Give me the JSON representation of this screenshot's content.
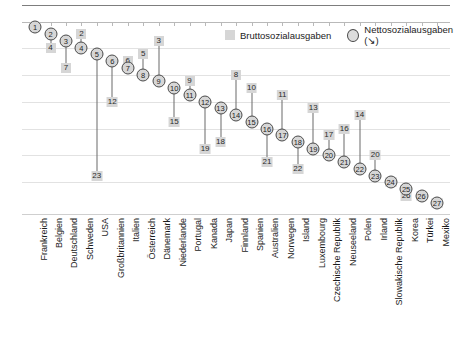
{
  "legend": {
    "gross_label": "Bruttosozialausgaben",
    "net_label": "Nettosozialausgaben (↘)",
    "gross_icon": "filled-square-marker",
    "net_icon": "circle-marker"
  },
  "chart_data": {
    "type": "scatter",
    "title": "",
    "subtitle": "",
    "xlabel": "",
    "ylabel": "",
    "ylim": [
      27.8,
      0.2
    ],
    "y_inverted": true,
    "grid": "horizontal",
    "legend_position": "top-right",
    "gridline_values": [
      4,
      8,
      12,
      16,
      20,
      24
    ],
    "categories": [
      "Frankreich",
      "Belgien",
      "Deutschland",
      "Schweden",
      "USA",
      "Großbritannien",
      "Italien",
      "Österreich",
      "Dänemark",
      "Niederlande",
      "Portugal",
      "Kanada",
      "Japan",
      "Finnland",
      "Spanien",
      "Australien",
      "Norwegen",
      "Island",
      "Luxembourg",
      "Czechische Republik",
      "Neuseeland",
      "Polen",
      "Irland",
      "Slowakische Republik",
      "Korea",
      "Türkei",
      "Mexiko"
    ],
    "series": [
      {
        "name": "Bruttosozialausgaben",
        "marker": "square",
        "values": [
          1,
          4,
          7,
          2,
          23,
          12,
          6,
          5,
          3,
          15,
          9,
          19,
          18,
          8,
          10,
          21,
          11,
          22,
          13,
          17,
          16,
          14,
          20,
          24,
          26,
          26,
          27
        ]
      },
      {
        "name": "Nettosozialausgaben (↘)",
        "marker": "circle",
        "values": [
          1,
          2,
          3,
          4,
          5,
          6,
          7,
          8,
          9,
          10,
          11,
          12,
          13,
          14,
          15,
          16,
          17,
          18,
          19,
          20,
          21,
          22,
          23,
          24,
          25,
          26,
          27
        ]
      }
    ],
    "points": [
      {
        "country": "Frankreich",
        "gross": 1,
        "net": 1
      },
      {
        "country": "Belgien",
        "gross": 4,
        "net": 2
      },
      {
        "country": "Deutschland",
        "gross": 7,
        "net": 3
      },
      {
        "country": "Schweden",
        "gross": 2,
        "net": 4
      },
      {
        "country": "USA",
        "gross": 23,
        "net": 5
      },
      {
        "country": "Großbritannien",
        "gross": 12,
        "net": 6
      },
      {
        "country": "Italien",
        "gross": 6,
        "net": 7
      },
      {
        "country": "Österreich",
        "gross": 5,
        "net": 8
      },
      {
        "country": "Dänemark",
        "gross": 3,
        "net": 9
      },
      {
        "country": "Niederlande",
        "gross": 15,
        "net": 10
      },
      {
        "country": "Portugal",
        "gross": 9,
        "net": 11
      },
      {
        "country": "Kanada",
        "gross": 19,
        "net": 12
      },
      {
        "country": "Japan",
        "gross": 18,
        "net": 13
      },
      {
        "country": "Finnland",
        "gross": 8,
        "net": 14
      },
      {
        "country": "Spanien",
        "gross": 10,
        "net": 15
      },
      {
        "country": "Australien",
        "gross": 21,
        "net": 16
      },
      {
        "country": "Norwegen",
        "gross": 11,
        "net": 17
      },
      {
        "country": "Island",
        "gross": 22,
        "net": 18
      },
      {
        "country": "Luxembourg",
        "gross": 13,
        "net": 19
      },
      {
        "country": "Czechische Republik",
        "gross": 17,
        "net": 20
      },
      {
        "country": "Neuseeland",
        "gross": 16,
        "net": 21
      },
      {
        "country": "Polen",
        "gross": 14,
        "net": 22
      },
      {
        "country": "Irland",
        "gross": 20,
        "net": 23
      },
      {
        "country": "Slowakische Republik",
        "gross": 24,
        "net": 24
      },
      {
        "country": "Korea",
        "gross": 26,
        "net": 25
      },
      {
        "country": "Türkei",
        "gross": 26,
        "net": 26
      },
      {
        "country": "Mexiko",
        "gross": 27,
        "net": 27
      }
    ]
  },
  "colors": {
    "marker_fill": "#d6d6d6",
    "marker_stroke": "#4a4a4a",
    "connector": "#6a6a6a",
    "gridline": "#e2e2e2",
    "text": "#1c1c1c"
  }
}
